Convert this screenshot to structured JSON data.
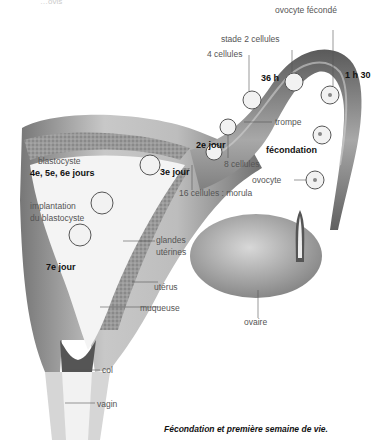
{
  "figure": {
    "caption": "Fécondation et première semaine de vie.",
    "header_fragment": "…ovis"
  },
  "labels": {
    "ovocyte_feconde": "ovocyte fécondé",
    "stade_2": "stade 2 cellules",
    "cellules_4": "4 cellules",
    "h36": "36 h",
    "h1_30": "1 h 30",
    "trompe": "trompe",
    "jour2": "2e jour",
    "fecondation": "fécondation",
    "cellules_8": "8 cellules",
    "blastocyste": "blastocyste",
    "jours456": "4e, 5e, 6e jours",
    "jour3": "3e jour",
    "ovocyte": "ovocyte",
    "morula": "16 cellules : morula",
    "implantation_1": "implantation",
    "implantation_2": "du blastocyste",
    "glandes_1": "glandes",
    "glandes_2": "utérines",
    "jour7": "7e jour",
    "uterus": "utérus",
    "muqueuse": "muqueuse",
    "ovaire": "ovaire",
    "col": "col",
    "vagin": "vagin"
  }
}
